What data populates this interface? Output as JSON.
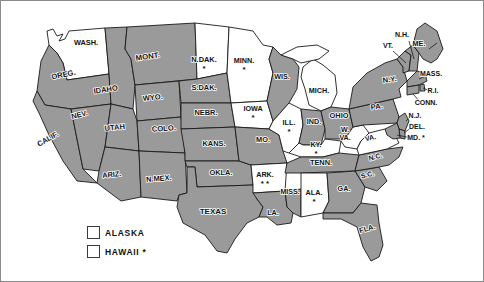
{
  "map": {
    "title": "United States Map",
    "colors": {
      "shaded": "#9a9a9a",
      "unshaded": "#ffffff",
      "outline": "#1a1a1a",
      "frame": "#8a8a8a",
      "text": "#111111"
    },
    "asterisk_glyph": "*",
    "states": [
      {
        "code": "WASH",
        "label": "WASH.",
        "shaded": false,
        "asterisks": 0,
        "lx": 85,
        "ly": 44,
        "size": 7.4
      },
      {
        "code": "OREG",
        "label": "OREG.",
        "shaded": true,
        "asterisks": 0,
        "lx": 63,
        "ly": 76,
        "size": 7.6,
        "rot": -12
      },
      {
        "code": "CALIF",
        "label": "CALIF.",
        "shaded": true,
        "asterisks": 0,
        "lx": 48,
        "ly": 140,
        "size": 7.4,
        "rot": -30
      },
      {
        "code": "NEV",
        "label": "NEV.",
        "shaded": true,
        "asterisks": 0,
        "lx": 79,
        "ly": 116,
        "size": 7.4,
        "rot": -14
      },
      {
        "code": "IDAHO",
        "label": "IDAHO",
        "shaded": true,
        "asterisks": 0,
        "lx": 105,
        "ly": 91,
        "size": 7.6,
        "rot": -8
      },
      {
        "code": "MONT",
        "label": "MONT.",
        "shaded": true,
        "asterisks": 0,
        "lx": 147,
        "ly": 58,
        "size": 7.8,
        "rot": -8
      },
      {
        "code": "WYO",
        "label": "WYO.",
        "shaded": true,
        "asterisks": 0,
        "lx": 152,
        "ly": 99,
        "size": 7.6,
        "rot": -6
      },
      {
        "code": "UTAH",
        "label": "UTAH",
        "shaded": true,
        "asterisks": 0,
        "lx": 114,
        "ly": 129,
        "size": 7.6,
        "rot": -6
      },
      {
        "code": "COLO",
        "label": "COLO.",
        "shaded": true,
        "asterisks": 0,
        "lx": 163,
        "ly": 130,
        "size": 7.6,
        "rot": -4
      },
      {
        "code": "ARIZ",
        "label": "ARIZ.",
        "shaded": true,
        "asterisks": 0,
        "lx": 111,
        "ly": 176,
        "size": 7.4,
        "rot": -6
      },
      {
        "code": "NMEX",
        "label": "N.MEX.",
        "shaded": true,
        "asterisks": 0,
        "lx": 158,
        "ly": 180,
        "size": 7.4,
        "rot": -4
      },
      {
        "code": "NDAK",
        "label": "N.DAK.",
        "shaded": false,
        "asterisks": 1,
        "lx": 203,
        "ly": 61,
        "size": 7.4
      },
      {
        "code": "SDAK",
        "label": "S.DAK.",
        "shaded": true,
        "asterisks": 0,
        "lx": 203,
        "ly": 89,
        "size": 7.4
      },
      {
        "code": "NEBR",
        "label": "NEBR.",
        "shaded": true,
        "asterisks": 0,
        "lx": 205,
        "ly": 114,
        "size": 7.4
      },
      {
        "code": "KANS",
        "label": "KANS.",
        "shaded": true,
        "asterisks": 0,
        "lx": 213,
        "ly": 145,
        "size": 7.4
      },
      {
        "code": "OKLA",
        "label": "OKLA.",
        "shaded": true,
        "asterisks": 0,
        "lx": 220,
        "ly": 174,
        "size": 7.4
      },
      {
        "code": "TEXAS",
        "label": "TEXAS",
        "shaded": true,
        "asterisks": 0,
        "lx": 212,
        "ly": 213,
        "size": 8.0
      },
      {
        "code": "MINN",
        "label": "MINN.",
        "shaded": false,
        "asterisks": 1,
        "lx": 243,
        "ly": 62,
        "size": 7.2
      },
      {
        "code": "IOWA",
        "label": "IOWA",
        "shaded": false,
        "asterisks": 1,
        "lx": 252,
        "ly": 110,
        "size": 7.2
      },
      {
        "code": "MO",
        "label": "MO.",
        "shaded": true,
        "asterisks": 0,
        "lx": 262,
        "ly": 141,
        "size": 7.4
      },
      {
        "code": "ARK",
        "label": "ARK.",
        "shaded": false,
        "asterisks": 2,
        "lx": 264,
        "ly": 176,
        "size": 7.2
      },
      {
        "code": "LA",
        "label": "LA.",
        "shaded": true,
        "asterisks": 0,
        "lx": 272,
        "ly": 214,
        "size": 7.2
      },
      {
        "code": "WIS",
        "label": "WIS.",
        "shaded": true,
        "asterisks": 0,
        "lx": 281,
        "ly": 78,
        "size": 7.2
      },
      {
        "code": "ILL",
        "label": "ILL.",
        "shaded": false,
        "asterisks": 1,
        "lx": 288,
        "ly": 124,
        "size": 7.2
      },
      {
        "code": "MISS",
        "label": "MISS.",
        "shaded": true,
        "asterisks": 0,
        "lx": 289,
        "ly": 193,
        "size": 7.0
      },
      {
        "code": "MICH",
        "label": "MICH.",
        "shaded": false,
        "asterisks": 0,
        "lx": 318,
        "ly": 92,
        "size": 7.2
      },
      {
        "code": "IND",
        "label": "IND.",
        "shaded": true,
        "asterisks": 0,
        "lx": 313,
        "ly": 123,
        "size": 7.2
      },
      {
        "code": "OHIO",
        "label": "OHIO",
        "shaded": true,
        "asterisks": 0,
        "lx": 338,
        "ly": 117,
        "size": 7.4
      },
      {
        "code": "KY",
        "label": "KY.",
        "shaded": false,
        "asterisks": 1,
        "lx": 315,
        "ly": 146,
        "size": 7.2
      },
      {
        "code": "TENN",
        "label": "TENN.",
        "shaded": true,
        "asterisks": 0,
        "lx": 320,
        "ly": 164,
        "size": 7.4
      },
      {
        "code": "ALA",
        "label": "ALA.",
        "shaded": false,
        "asterisks": 1,
        "lx": 313,
        "ly": 194,
        "size": 7.2
      },
      {
        "code": "GA",
        "label": "GA.",
        "shaded": true,
        "asterisks": 0,
        "lx": 343,
        "ly": 190,
        "size": 7.2
      },
      {
        "code": "FLA",
        "label": "FLA.",
        "shaded": true,
        "asterisks": 0,
        "lx": 367,
        "ly": 230,
        "size": 7.4,
        "rot": -16
      },
      {
        "code": "SC",
        "label": "S.C.",
        "shaded": true,
        "asterisks": 0,
        "lx": 367,
        "ly": 176,
        "size": 7.0,
        "rot": -14
      },
      {
        "code": "NC",
        "label": "N.C.",
        "shaded": true,
        "asterisks": 0,
        "lx": 375,
        "ly": 158,
        "size": 7.0,
        "rot": -14
      },
      {
        "code": "WVA",
        "label": "W.",
        "label2": "VA.",
        "shaded": false,
        "asterisks": 0,
        "lx": 344,
        "ly": 131,
        "size": 7.0
      },
      {
        "code": "VA",
        "label": "VA.",
        "shaded": false,
        "asterisks": 0,
        "lx": 370,
        "ly": 139,
        "size": 7.0,
        "rot": -12
      },
      {
        "code": "PA",
        "label": "PA.",
        "shaded": true,
        "asterisks": 0,
        "lx": 376,
        "ly": 108,
        "size": 7.6,
        "rot": -8
      },
      {
        "code": "NY",
        "label": "N.Y.",
        "shaded": true,
        "asterisks": 0,
        "lx": 389,
        "ly": 81,
        "size": 7.6,
        "rot": -8
      },
      {
        "code": "VT",
        "label": "VT.",
        "shaded": true,
        "asterisks": 0,
        "lx": 387,
        "ly": 47,
        "size": 7.0
      },
      {
        "code": "NH",
        "label": "N.H.",
        "shaded": true,
        "asterisks": 0,
        "lx": 401,
        "ly": 36,
        "size": 7.0
      },
      {
        "code": "ME",
        "label": "ME.",
        "shaded": true,
        "asterisks": 0,
        "lx": 418,
        "ly": 45,
        "size": 7.2
      },
      {
        "code": "MASS",
        "label": "MASS.",
        "shaded": true,
        "asterisks": 0,
        "lx": 430,
        "ly": 75,
        "size": 7.0
      },
      {
        "code": "RI",
        "label": "R.I.",
        "shaded": true,
        "asterisks": 0,
        "lx": 432,
        "ly": 92,
        "size": 7.0
      },
      {
        "code": "CONN",
        "label": "CONN.",
        "shaded": true,
        "asterisks": 0,
        "lx": 425,
        "ly": 104,
        "size": 7.0
      },
      {
        "code": "NJ",
        "label": "N.J.",
        "shaded": true,
        "asterisks": 0,
        "lx": 414,
        "ly": 117,
        "size": 7.0
      },
      {
        "code": "DEL",
        "label": "DEL.",
        "shaded": true,
        "asterisks": 0,
        "lx": 416,
        "ly": 128,
        "size": 7.0
      },
      {
        "code": "MD",
        "label": "MD.",
        "shaded": true,
        "asterisks": 1,
        "lx": 415,
        "ly": 139,
        "size": 7.0,
        "ast_inline": true
      }
    ],
    "legend": {
      "items": [
        {
          "label": "ALASKA",
          "shaded": false,
          "asterisks": 0
        },
        {
          "label": "HAWAII",
          "shaded": false,
          "asterisks": 1
        }
      ]
    }
  }
}
